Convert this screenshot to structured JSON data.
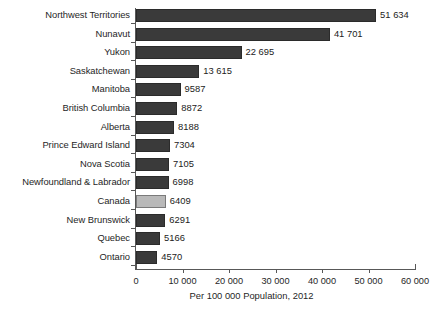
{
  "chart_data": {
    "type": "bar",
    "orientation": "horizontal",
    "title": "",
    "xlabel": "Per 100 000 Population, 2012",
    "ylabel": "",
    "xlim": [
      0,
      60000
    ],
    "grid": false,
    "legend": "none",
    "xticks": [
      "0",
      "10 000",
      "20 000",
      "30 000",
      "40 000",
      "50 000",
      "60 000"
    ],
    "xtick_values": [
      0,
      10000,
      20000,
      30000,
      40000,
      50000,
      60000
    ],
    "categories": [
      "Northwest Territories",
      "Nunavut",
      "Yukon",
      "Saskatchewan",
      "Manitoba",
      "British Columbia",
      "Alberta",
      "Prince Edward Island",
      "Nova Scotia",
      "Newfoundland & Labrador",
      "Canada",
      "New Brunswick",
      "Quebec",
      "Ontario"
    ],
    "values": [
      51634,
      41701,
      22695,
      13615,
      9587,
      8872,
      8188,
      7304,
      7105,
      6998,
      6409,
      6291,
      5166,
      4570
    ],
    "value_labels": [
      "51 634",
      "41 701",
      "22 695",
      "13 615",
      "9587",
      "8872",
      "8188",
      "7304",
      "7105",
      "6998",
      "6409",
      "6291",
      "5166",
      "4570"
    ],
    "highlighted_category": "Canada",
    "colors": {
      "bar": "#3a3a3a",
      "bar_highlight": "#b9b9b9",
      "axis": "#585858",
      "text": "#262626",
      "background": "#ffffff"
    }
  }
}
